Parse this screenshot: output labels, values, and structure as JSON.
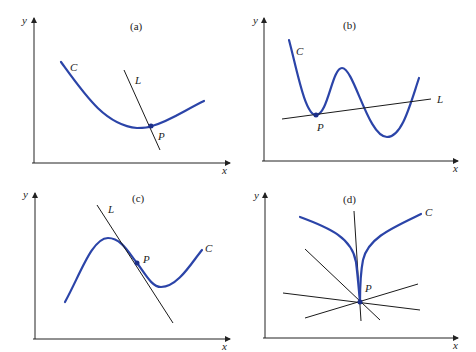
{
  "figure": {
    "panels": [
      {
        "id": "a",
        "title": "(a)",
        "axis_labels": {
          "x": "x",
          "y": "y"
        },
        "curve_label": "C",
        "line_label": "L",
        "point_label": "P",
        "description": "Line L crosses curve C at point P (not tangent)"
      },
      {
        "id": "b",
        "title": "(b)",
        "axis_labels": {
          "x": "x",
          "y": "y"
        },
        "curve_label": "C",
        "line_label": "L",
        "point_label": "P",
        "description": "Line L tangent to C at P but intersecting C elsewhere"
      },
      {
        "id": "c",
        "title": "(c)",
        "axis_labels": {
          "x": "x",
          "y": "y"
        },
        "curve_label": "C",
        "line_label": "L",
        "point_label": "P",
        "description": "Line L tangent to C at inflection point P, crossing curve"
      },
      {
        "id": "d",
        "title": "(d)",
        "axis_labels": {
          "x": "x",
          "y": "y"
        },
        "curve_label": "C",
        "point_label": "P",
        "description": "Cusp at P with several lines through P"
      }
    ],
    "colors": {
      "curve": "#2b44a8",
      "line": "#1a1a1a",
      "point": "#1c2f8a",
      "background": "#ffffff"
    }
  }
}
